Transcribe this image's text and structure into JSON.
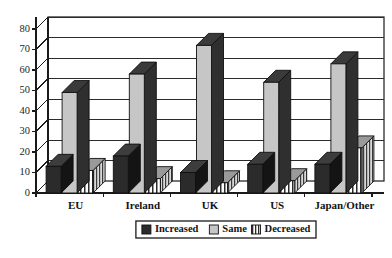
{
  "chart_data": {
    "type": "bar",
    "title": "",
    "subtitle": "",
    "xlabel": "",
    "ylabel": "",
    "ylim": [
      0,
      80
    ],
    "ytick_step": 10,
    "yticks": [
      "0",
      "10",
      "20",
      "30",
      "40",
      "50",
      "60",
      "70",
      "80"
    ],
    "grid": true,
    "grid_axis": "y",
    "legend_position": "bottom-right",
    "style": "3d-grouped-columns",
    "categories": [
      "EU",
      "Ireland",
      "UK",
      "US",
      "Japan/Other"
    ],
    "series": [
      {
        "name": "Increased",
        "values": [
          13,
          18,
          10,
          14,
          14
        ],
        "fill": "#2b2b2b",
        "pattern": "solid-dark"
      },
      {
        "name": "Same",
        "values": [
          49,
          58,
          72,
          54,
          63
        ],
        "fill": "#c6c6c6",
        "pattern": "solid-light"
      },
      {
        "name": "Decreased",
        "values": [
          11,
          7,
          5,
          6,
          22
        ],
        "fill": "#ffffff",
        "pattern": "vertical-stripes"
      }
    ]
  },
  "legend": {
    "entries": [
      {
        "label": "Increased",
        "swatch": "solid-dark"
      },
      {
        "label": "Same",
        "swatch": "solid-light"
      },
      {
        "label": "Decreased",
        "swatch": "vertical-stripes"
      }
    ]
  },
  "colors": {
    "increased": "#2b2b2b",
    "same": "#c6c6c6",
    "decreased": "#ffffff",
    "outline": "#101010",
    "grid": "#2b2b2b",
    "background": "#ffffff"
  }
}
